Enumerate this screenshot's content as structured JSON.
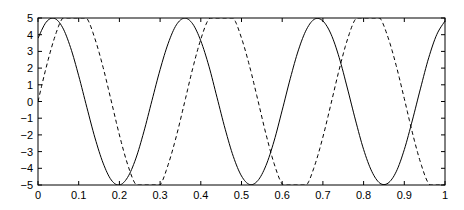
{
  "chart_data": {
    "type": "line",
    "title": "",
    "xlabel": "",
    "ylabel": "",
    "xlim": [
      0,
      1
    ],
    "ylim": [
      -5,
      5
    ],
    "grid": false,
    "legend": null,
    "x_ticks": [
      0,
      0.1,
      0.2,
      0.3,
      0.4,
      0.5,
      0.6,
      0.7,
      0.8,
      0.9,
      1
    ],
    "x_tick_labels": [
      "0",
      "0.1",
      "0.2",
      "0.3",
      "0.4",
      "0.5",
      "0.6",
      "0.7",
      "0.8",
      "0.9",
      "1"
    ],
    "y_ticks": [
      5,
      4,
      3,
      2,
      1,
      0,
      -1,
      -2,
      -3,
      -4,
      -5
    ],
    "y_tick_labels": [
      "5",
      "4",
      "3",
      "2",
      "1",
      "0",
      "-1",
      "-2",
      "-3",
      "-4",
      "-5"
    ],
    "x": [
      0,
      0.02,
      0.04,
      0.06,
      0.08,
      0.1,
      0.12,
      0.14,
      0.16,
      0.18,
      0.2,
      0.22,
      0.24,
      0.26,
      0.28,
      0.3,
      0.32,
      0.34,
      0.36,
      0.38,
      0.4,
      0.42,
      0.44,
      0.46,
      0.48,
      0.5,
      0.52,
      0.54,
      0.56,
      0.58,
      0.6,
      0.62,
      0.64,
      0.66,
      0.68,
      0.7,
      0.72,
      0.74,
      0.76,
      0.78,
      0.8,
      0.82,
      0.84,
      0.86,
      0.88,
      0.9,
      0.92,
      0.94,
      0.96,
      0.98,
      1
    ],
    "series": [
      {
        "name": "solid",
        "style": "solid",
        "color": "#000000",
        "values": [
          3.79,
          4.75,
          4.98,
          4.45,
          3.23,
          1.54,
          -0.35,
          -2.18,
          -3.69,
          -4.7,
          -5.0,
          -4.55,
          -3.44,
          -1.82,
          0.06,
          1.91,
          3.49,
          4.59,
          4.99,
          4.65,
          3.63,
          2.11,
          0.23,
          -1.66,
          -3.3,
          -4.46,
          -4.97,
          -4.74,
          -3.84,
          -2.37,
          -0.52,
          1.39,
          3.09,
          4.33,
          4.94,
          4.82,
          4.03,
          2.63,
          0.81,
          -1.11,
          -2.87,
          -4.18,
          -4.89,
          -4.89,
          -4.21,
          -2.88,
          -1.11,
          0.8,
          2.62,
          4.02,
          4.82
        ]
      },
      {
        "name": "dashed",
        "style": "dashed",
        "color": "#000000",
        "values": [
          0.0,
          2.03,
          3.77,
          4.97,
          5.0,
          5.0,
          4.98,
          3.75,
          2.04,
          0.03,
          -2.0,
          -3.75,
          -4.96,
          -5.0,
          -5.0,
          -5.0,
          -3.77,
          -2.07,
          -0.07,
          1.97,
          3.73,
          4.95,
          5.0,
          5.0,
          5.0,
          3.8,
          2.1,
          0.1,
          -1.94,
          -3.71,
          -4.94,
          -5.0,
          -5.0,
          -5.0,
          -3.82,
          -2.13,
          -0.13,
          1.91,
          3.69,
          4.93,
          5.0,
          5.0,
          5.0,
          3.84,
          2.16,
          0.17,
          -1.88,
          -3.66,
          -4.92,
          -5.0,
          -5.0
        ]
      }
    ]
  }
}
